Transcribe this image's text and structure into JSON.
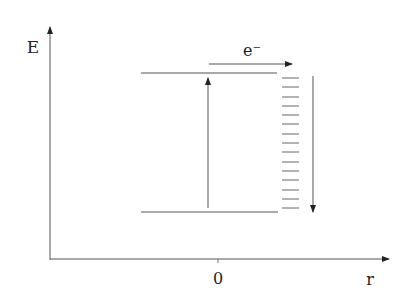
{
  "diagram": {
    "axes": {
      "y_label": "E",
      "x_label": "r",
      "x_tick_label": "0"
    },
    "electron_label": "e⁻",
    "levels": {
      "upper": "upper-energy-level",
      "lower": "lower-energy-level"
    },
    "band": {
      "dash_count": 15
    },
    "colors": {
      "line": "#333333",
      "background": "#ffffff"
    }
  }
}
